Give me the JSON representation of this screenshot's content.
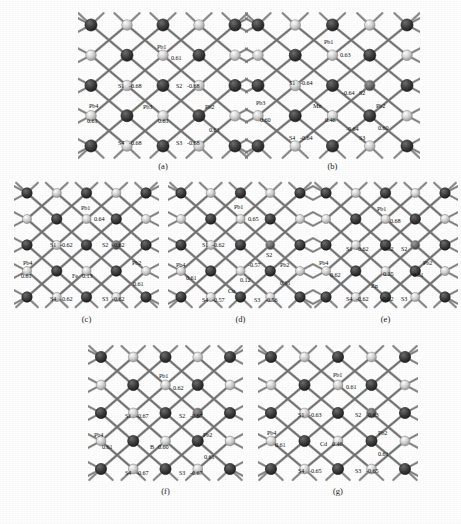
{
  "figure": {
    "background_color": "#fefefe"
  },
  "palette": {
    "lead_atom": "#3a3a3a",
    "sulfur_atom": "#c9c9c9",
    "dopant_atom": "#6e6e6e",
    "bond": "#8a8a8a",
    "bond_dark": "#4a4a4a",
    "label_text": "#101010"
  },
  "panels": [
    {
      "id": "a",
      "caption": "(a)",
      "dopant": null,
      "labels": [
        {
          "name": "Pb1",
          "charge": "0.61"
        },
        {
          "name": "S1",
          "charge": "-0.68"
        },
        {
          "name": "S2",
          "charge": "-0.68"
        },
        {
          "name": "Pb4",
          "charge": "0.61"
        },
        {
          "name": "Pb3",
          "charge": "0.61"
        },
        {
          "name": "Pb2",
          "charge": "0.61"
        },
        {
          "name": "S4",
          "charge": "-0.68"
        },
        {
          "name": "S3",
          "charge": "-0.68"
        }
      ]
    },
    {
      "id": "b",
      "caption": "(b)",
      "dopant": {
        "name": "Mn",
        "charge": "0.46"
      },
      "labels": [
        {
          "name": "Pb1",
          "charge": "0.63"
        },
        {
          "name": "S1",
          "charge": "-0.64"
        },
        {
          "name": "S2",
          "charge": "-0.64"
        },
        {
          "name": "Pb3",
          "charge": "0.60"
        },
        {
          "name": "Mn",
          "charge": "0.46"
        },
        {
          "name": "Pb2",
          "charge": "0.60"
        },
        {
          "name": "S4",
          "charge": "-0.64"
        },
        {
          "name": "S3",
          "charge": "-0.64"
        }
      ]
    },
    {
      "id": "c",
      "caption": "(c)",
      "dopant": {
        "name": "Fe",
        "charge": "0.13"
      },
      "labels": [
        {
          "name": "Pb1",
          "charge": "0.64"
        },
        {
          "name": "S1",
          "charge": "-0.62"
        },
        {
          "name": "S2",
          "charge": "-0.62"
        },
        {
          "name": "Pb4",
          "charge": "0.61"
        },
        {
          "name": "Fe",
          "charge": "0.13"
        },
        {
          "name": "Pb2",
          "charge": "0.61"
        },
        {
          "name": "S4",
          "charge": "-0.62"
        },
        {
          "name": "S3",
          "charge": "-0.62"
        }
      ]
    },
    {
      "id": "d",
      "caption": "(d)",
      "dopant": {
        "name": "Cu",
        "charge": "0.12"
      },
      "labels": [
        {
          "name": "Pb1",
          "charge": "0.65"
        },
        {
          "name": "S1",
          "charge": "-0.62"
        },
        {
          "name": "S2",
          "charge": "-0.57"
        },
        {
          "name": "Pb4",
          "charge": "0.61"
        },
        {
          "name": "Cu",
          "charge": "0.12"
        },
        {
          "name": "Pb2",
          "charge": "0.61"
        },
        {
          "name": "S4",
          "charge": "-0.57"
        },
        {
          "name": "S3",
          "charge": "-0.56"
        }
      ]
    },
    {
      "id": "e",
      "caption": "(e)",
      "dopant": {
        "name": "Zn",
        "charge": "0.25"
      },
      "labels": [
        {
          "name": "Pb1",
          "charge": "0.68"
        },
        {
          "name": "S1",
          "charge": "-0.62"
        },
        {
          "name": "S2",
          "charge": "-0.62"
        },
        {
          "name": "Pb4",
          "charge": "0.62"
        },
        {
          "name": "Zn",
          "charge": "0.25"
        },
        {
          "name": "Pb2",
          "charge": "0.61"
        },
        {
          "name": "S4",
          "charge": "-0.62"
        },
        {
          "name": "S3",
          "charge": "-0.62"
        }
      ]
    },
    {
      "id": "f",
      "caption": "(f)",
      "dopant": {
        "name": "B",
        "charge": "0.60"
      },
      "labels": [
        {
          "name": "Pb1",
          "charge": "0.62"
        },
        {
          "name": "S1",
          "charge": "-0.67"
        },
        {
          "name": "S2",
          "charge": "-0.67"
        },
        {
          "name": "Pb4",
          "charge": "0.61"
        },
        {
          "name": "B",
          "charge": "0.60"
        },
        {
          "name": "Pb2",
          "charge": "0.61"
        },
        {
          "name": "S4",
          "charge": "-0.67"
        },
        {
          "name": "S3",
          "charge": "-0.67"
        }
      ]
    },
    {
      "id": "g",
      "caption": "(g)",
      "dopant": {
        "name": "Cd",
        "charge": "0.46"
      },
      "labels": [
        {
          "name": "Pb1",
          "charge": "0.61"
        },
        {
          "name": "S1",
          "charge": "-0.63"
        },
        {
          "name": "S2",
          "charge": "-0.63"
        },
        {
          "name": "Pb4",
          "charge": "0.61"
        },
        {
          "name": "Cd",
          "charge": "0.46"
        },
        {
          "name": "Pb2",
          "charge": "0.61"
        },
        {
          "name": "S4",
          "charge": "-0.65"
        },
        {
          "name": "S3",
          "charge": "-0.65"
        }
      ]
    }
  ]
}
